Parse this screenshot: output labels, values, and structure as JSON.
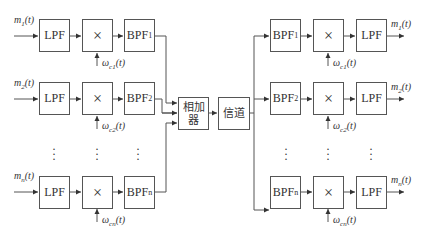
{
  "diagram": {
    "title": "",
    "transmitter": {
      "rows": [
        {
          "input": "m",
          "input_sub": "1",
          "input_suffix": "(t)",
          "lpf": "LPF",
          "mult": "×",
          "bpf": "BPF",
          "bpf_sub": "1",
          "carrier": "ω",
          "carrier_sub": "c1",
          "carrier_suffix": "(t)"
        },
        {
          "input": "m",
          "input_sub": "2",
          "input_suffix": "(t)",
          "lpf": "LPF",
          "mult": "×",
          "bpf": "BPF",
          "bpf_sub": "2",
          "carrier": "ω",
          "carrier_sub": "c2",
          "carrier_suffix": "(t)"
        },
        {
          "input": "m",
          "input_sub": "n",
          "input_suffix": "(t)",
          "lpf": "LPF",
          "mult": "×",
          "bpf": "BPF",
          "bpf_sub": "n",
          "carrier": "ω",
          "carrier_sub": "cn",
          "carrier_suffix": "(t)"
        }
      ]
    },
    "adder": {
      "line1": "相加",
      "line2": "器"
    },
    "channel": {
      "label": "信道"
    },
    "receiver": {
      "rows": [
        {
          "bpf": "BPF",
          "bpf_sub": "1",
          "mult": "×",
          "lpf": "LPF",
          "output": "m",
          "output_sub": "1",
          "output_suffix": "(t)",
          "carrier": "ω",
          "carrier_sub": "c1",
          "carrier_suffix": "(t)"
        },
        {
          "bpf": "BPF",
          "bpf_sub": "2",
          "mult": "×",
          "lpf": "LPF",
          "output": "m",
          "output_sub": "2",
          "output_suffix": "(t)",
          "carrier": "ω",
          "carrier_sub": "c2",
          "carrier_suffix": "(t)"
        },
        {
          "bpf": "BPF",
          "bpf_sub": "n",
          "mult": "×",
          "lpf": "LPF",
          "output": "m",
          "output_sub": "n",
          "output_suffix": "(t)",
          "carrier": "ω",
          "carrier_sub": "cn",
          "carrier_suffix": "(t)"
        }
      ]
    },
    "ellipsis": "⋮",
    "colors": {
      "line": "#555555",
      "text": "#333333",
      "background": "#ffffff"
    }
  }
}
